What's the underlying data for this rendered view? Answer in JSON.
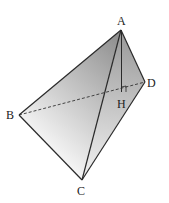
{
  "diagram": {
    "type": "tetrahedron",
    "vertices": {
      "A": {
        "label": "A",
        "x": 121,
        "y": 30
      },
      "B": {
        "label": "B",
        "x": 19,
        "y": 115
      },
      "C": {
        "label": "C",
        "x": 82,
        "y": 180
      },
      "D": {
        "label": "D",
        "x": 145,
        "y": 82
      },
      "H": {
        "label": "H",
        "x": 122,
        "y": 90
      }
    },
    "edges_solid": [
      "AB",
      "AC",
      "AD",
      "BC",
      "CD",
      "AH"
    ],
    "edges_dashed": [
      "BD"
    ],
    "right_angle_at": "H",
    "colors": {
      "edge": "#2a2a2a",
      "face_abc_dark": "#8c8c8c",
      "face_abc_light": "#f2f2f2",
      "face_acd_dark": "#a6a6a6",
      "face_acd_light": "#e6e6e6"
    }
  }
}
